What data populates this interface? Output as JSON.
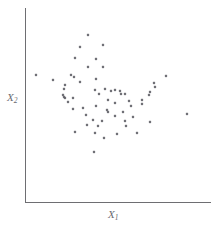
{
  "chart_data": {
    "type": "scatter",
    "title": "",
    "subtitle": "",
    "xlabel": "X",
    "xlabel_sub": "1",
    "ylabel": "X",
    "ylabel_sub": "2",
    "xlabel_full": "X1",
    "ylabel_full": "X2",
    "grid": false,
    "legend": "none",
    "xticks": [],
    "yticks": [],
    "xlim": [
      0,
      1
    ],
    "ylim": [
      0,
      1
    ],
    "axis_color": "#6e6e72",
    "point_color": "#5a5a60",
    "background_color": "#ffffff",
    "n_points": 62,
    "points": [
      {
        "x": 0.339,
        "y": 0.859
      },
      {
        "x": 0.296,
        "y": 0.797
      },
      {
        "x": 0.419,
        "y": 0.807
      },
      {
        "x": 0.269,
        "y": 0.741
      },
      {
        "x": 0.382,
        "y": 0.738
      },
      {
        "x": 0.339,
        "y": 0.697
      },
      {
        "x": 0.419,
        "y": 0.695
      },
      {
        "x": 0.059,
        "y": 0.654
      },
      {
        "x": 0.247,
        "y": 0.654
      },
      {
        "x": 0.264,
        "y": 0.644
      },
      {
        "x": 0.758,
        "y": 0.651
      },
      {
        "x": 0.382,
        "y": 0.636
      },
      {
        "x": 0.151,
        "y": 0.631
      },
      {
        "x": 0.296,
        "y": 0.621
      },
      {
        "x": 0.694,
        "y": 0.615
      },
      {
        "x": 0.215,
        "y": 0.605
      },
      {
        "x": 0.699,
        "y": 0.595
      },
      {
        "x": 0.21,
        "y": 0.585
      },
      {
        "x": 0.43,
        "y": 0.584
      },
      {
        "x": 0.376,
        "y": 0.579
      },
      {
        "x": 0.462,
        "y": 0.574
      },
      {
        "x": 0.484,
        "y": 0.577
      },
      {
        "x": 0.511,
        "y": 0.574
      },
      {
        "x": 0.672,
        "y": 0.569
      },
      {
        "x": 0.398,
        "y": 0.559
      },
      {
        "x": 0.516,
        "y": 0.559
      },
      {
        "x": 0.538,
        "y": 0.556
      },
      {
        "x": 0.204,
        "y": 0.551
      },
      {
        "x": 0.667,
        "y": 0.549
      },
      {
        "x": 0.21,
        "y": 0.543
      },
      {
        "x": 0.215,
        "y": 0.538
      },
      {
        "x": 0.258,
        "y": 0.538
      },
      {
        "x": 0.446,
        "y": 0.528
      },
      {
        "x": 0.629,
        "y": 0.526
      },
      {
        "x": 0.559,
        "y": 0.523
      },
      {
        "x": 0.231,
        "y": 0.513
      },
      {
        "x": 0.484,
        "y": 0.51
      },
      {
        "x": 0.629,
        "y": 0.505
      },
      {
        "x": 0.382,
        "y": 0.497
      },
      {
        "x": 0.57,
        "y": 0.495
      },
      {
        "x": 0.312,
        "y": 0.487
      },
      {
        "x": 0.258,
        "y": 0.479
      },
      {
        "x": 0.441,
        "y": 0.474
      },
      {
        "x": 0.446,
        "y": 0.466
      },
      {
        "x": 0.527,
        "y": 0.464
      },
      {
        "x": 0.871,
        "y": 0.454
      },
      {
        "x": 0.328,
        "y": 0.449
      },
      {
        "x": 0.484,
        "y": 0.444
      },
      {
        "x": 0.581,
        "y": 0.436
      },
      {
        "x": 0.366,
        "y": 0.421
      },
      {
        "x": 0.414,
        "y": 0.418
      },
      {
        "x": 0.538,
        "y": 0.415
      },
      {
        "x": 0.672,
        "y": 0.413
      },
      {
        "x": 0.333,
        "y": 0.397
      },
      {
        "x": 0.392,
        "y": 0.392
      },
      {
        "x": 0.543,
        "y": 0.39
      },
      {
        "x": 0.269,
        "y": 0.359
      },
      {
        "x": 0.376,
        "y": 0.356
      },
      {
        "x": 0.602,
        "y": 0.354
      },
      {
        "x": 0.494,
        "y": 0.349
      },
      {
        "x": 0.371,
        "y": 0.256
      },
      {
        "x": 0.425,
        "y": 0.331
      }
    ]
  },
  "figure": {
    "width": 218,
    "height": 229
  }
}
